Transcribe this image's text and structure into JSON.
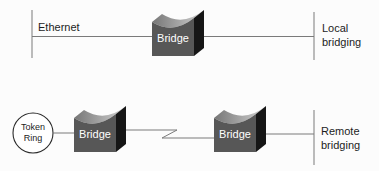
{
  "colors": {
    "background": "#fcfcfc",
    "line": "#7a7a7a",
    "text": "#1c1c1c",
    "bridge_front": "#575757",
    "bridge_side": "#161616",
    "bridge_top_dark": "#767676",
    "bridge_top_light": "#d2d2d2",
    "bridge_label_color": "#ffffff",
    "node_fill": "#ffffff",
    "node_stroke": "#2a2a2a"
  },
  "local": {
    "segment_label": "Ethernet",
    "bridge_label": "Bridge",
    "caption_line1": "Local",
    "caption_line2": "bridging"
  },
  "remote": {
    "node_line1": "Token",
    "node_line2": "Ring",
    "bridge1_label": "Bridge",
    "bridge2_label": "Bridge",
    "caption_line1": "Remote",
    "caption_line2": "bridging"
  }
}
